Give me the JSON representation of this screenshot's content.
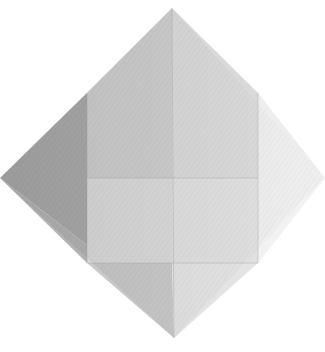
{
  "image": {
    "alt": "Photograph of a square sheet of paper folded into an origami base, shown as a diamond with crease lines",
    "background": "#ffffff",
    "subject": "folded paper diamond",
    "facets": [
      {
        "name": "left-outer-flap",
        "points": "0,178 87,93 87,245",
        "color": "#a9a9a9"
      },
      {
        "name": "top-left-panel",
        "points": "87,93 172,8 172,178 87,178",
        "color": "#cdcdcd"
      },
      {
        "name": "top-right-panel",
        "points": "172,8 258,93 258,178 172,178",
        "color": "#d9d9d9"
      },
      {
        "name": "right-outer-flap",
        "points": "258,93 325,178 258,245",
        "color": "#eeeeee"
      },
      {
        "name": "mid-left-panel",
        "points": "87,178 172,178 172,263 87,263",
        "color": "#dadada"
      },
      {
        "name": "mid-right-panel",
        "points": "172,178 258,178 258,263 172,263",
        "color": "#e0e0e0"
      },
      {
        "name": "left-outer-low",
        "points": "0,178 87,245 87,263",
        "color": "#b3b3b3"
      },
      {
        "name": "right-outer-low",
        "points": "325,178 258,245 258,263",
        "color": "#f2f2f2"
      },
      {
        "name": "bottom-left-tri",
        "points": "87,263 172,263 174,338",
        "color": "#c9c9c9"
      },
      {
        "name": "bottom-right-tri",
        "points": "172,263 258,263 174,338",
        "color": "#e4e4e4"
      }
    ],
    "creases": [
      {
        "x1": 172,
        "y1": 8,
        "x2": 174,
        "y2": 338
      },
      {
        "x1": 87,
        "y1": 93,
        "x2": 87,
        "y2": 263
      },
      {
        "x1": 258,
        "y1": 93,
        "x2": 258,
        "y2": 263
      },
      {
        "x1": 87,
        "y1": 178,
        "x2": 258,
        "y2": 178
      },
      {
        "x1": 87,
        "y1": 263,
        "x2": 258,
        "y2": 263
      }
    ]
  }
}
